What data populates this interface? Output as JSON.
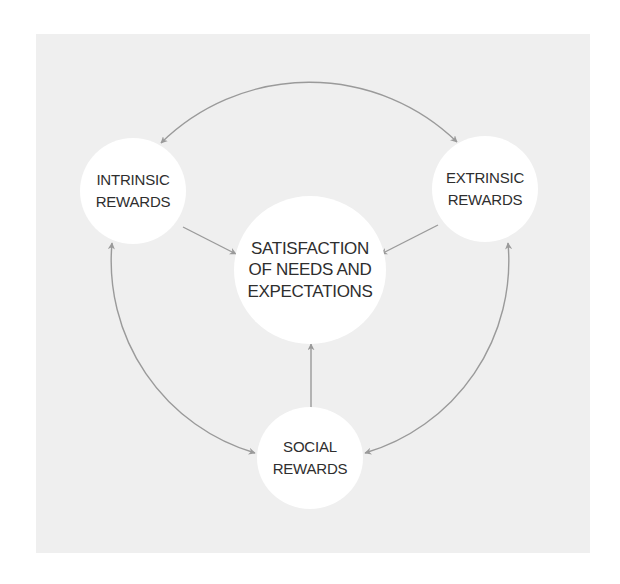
{
  "diagram": {
    "type": "cycle-with-hub",
    "colors": {
      "panel_background": "#efefef",
      "node_fill": "#ffffff",
      "arrow": "#9a9a9a",
      "text": "#2e2e2e"
    },
    "center_node": {
      "id": "satisfaction",
      "lines": [
        "SATISFACTION",
        "OF NEEDS AND",
        "EXPECTATIONS"
      ]
    },
    "outer_nodes": [
      {
        "id": "intrinsic",
        "lines": [
          "INTRINSIC",
          "REWARDS"
        ]
      },
      {
        "id": "extrinsic",
        "lines": [
          "EXTRINSIC",
          "REWARDS"
        ]
      },
      {
        "id": "social",
        "lines": [
          "SOCIAL",
          "REWARDS"
        ]
      }
    ],
    "edges": [
      {
        "from": "intrinsic",
        "to": "satisfaction",
        "style": "straight",
        "direction": "one-way"
      },
      {
        "from": "extrinsic",
        "to": "satisfaction",
        "style": "straight",
        "direction": "one-way"
      },
      {
        "from": "social",
        "to": "satisfaction",
        "style": "straight",
        "direction": "one-way"
      },
      {
        "from": "intrinsic",
        "to": "extrinsic",
        "style": "arc",
        "direction": "two-way"
      },
      {
        "from": "intrinsic",
        "to": "social",
        "style": "arc",
        "direction": "two-way"
      },
      {
        "from": "extrinsic",
        "to": "social",
        "style": "arc",
        "direction": "two-way"
      }
    ]
  }
}
